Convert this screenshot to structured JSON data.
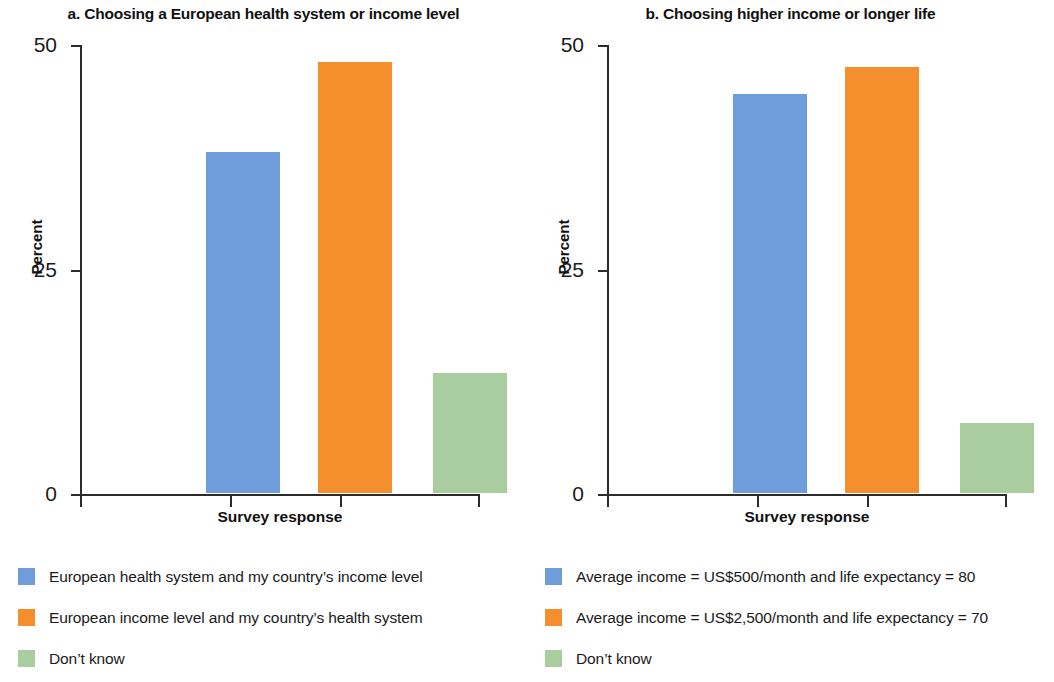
{
  "colors": {
    "series_blue": "#6f9cdb",
    "series_orange": "#f58f2d",
    "series_green": "#a9cd9e",
    "axis": "#2b2b2b",
    "text": "#1a1a1a"
  },
  "chart_data": [
    {
      "type": "bar",
      "panel": "a",
      "title": "a. Choosing a European health system or income level",
      "xlabel": "Survey response",
      "ylabel": "Percent",
      "ylim": [
        0,
        50
      ],
      "yticks": [
        0,
        25,
        50
      ],
      "ytick_labels": [
        "0",
        "25",
        "50"
      ],
      "grid": false,
      "legend_position": "below",
      "categories": [
        "European health system and my country’s income level",
        "European income level and my country’s health system",
        "Don’t know"
      ],
      "values": [
        38,
        48,
        13.4
      ],
      "bar_colors": [
        "#6f9cdb",
        "#f58f2d",
        "#a9cd9e"
      ]
    },
    {
      "type": "bar",
      "panel": "b",
      "title": "b. Choosing higher income or longer life",
      "xlabel": "Survey response",
      "ylabel": "Percent",
      "ylim": [
        0,
        50
      ],
      "yticks": [
        0,
        25,
        50
      ],
      "ytick_labels": [
        "0",
        "25",
        "50"
      ],
      "grid": false,
      "legend_position": "below",
      "categories": [
        "Average income = US$500/month and life expectancy = 80",
        "Average income = US$2,500/month and life expectancy = 70",
        "Don’t know"
      ],
      "values": [
        44.4,
        47.4,
        7.8
      ],
      "bar_colors": [
        "#6f9cdb",
        "#f58f2d",
        "#a9cd9e"
      ]
    }
  ]
}
